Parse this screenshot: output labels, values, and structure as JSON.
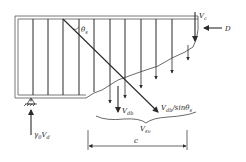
{
  "diagram": {
    "type": "beam-shear-free-body",
    "colors": {
      "line": "#2a2a2a",
      "outline": "#555555",
      "background": "#ffffff"
    },
    "labels": {
      "theta": "θ",
      "theta_sub": "s",
      "vc": "V",
      "vc_sub": "c",
      "d": "D",
      "vdb": "V",
      "vdb_sub": "db",
      "vdb_sin": "V",
      "vdb_sin_sub": "db",
      "vdb_sin_rest": "/sinθ",
      "vdb_sin_sub2": "s",
      "vsv": "V",
      "vsv_sub": "sv",
      "c": "c",
      "gamma": "γ",
      "gamma_sub": "0",
      "vd": "V",
      "vd_sub": "d"
    },
    "stirrups_x": [
      33,
      48,
      63,
      79,
      94,
      110,
      125,
      141,
      156,
      172
    ],
    "stirrup_force_arrows_x": [
      110,
      125,
      141,
      156,
      172,
      188
    ]
  }
}
